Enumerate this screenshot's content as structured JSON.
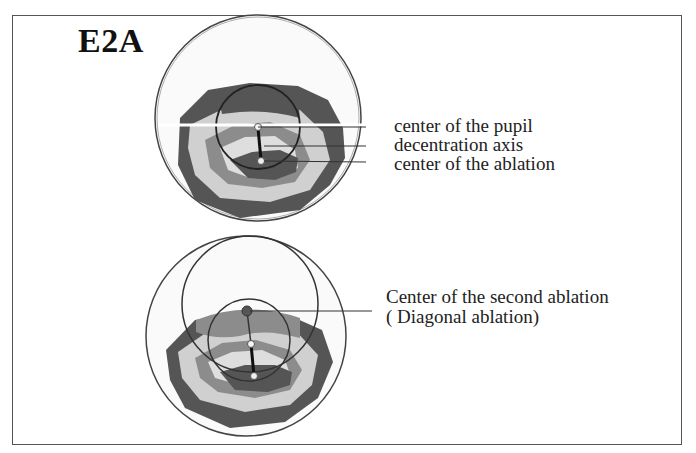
{
  "figure": {
    "title": "E2A",
    "top_diagram": {
      "labels": [
        "center of the pupil",
        "decentration axis",
        "center of the ablation"
      ]
    },
    "bottom_diagram": {
      "labels": [
        "Center of the second ablation",
        "( Diagonal ablation)"
      ]
    },
    "colors": {
      "dark": "#555555",
      "mid": "#8c8c8c",
      "light": "#cfcfcf",
      "lightest": "#e8e8e8",
      "frame": "#555555"
    }
  }
}
